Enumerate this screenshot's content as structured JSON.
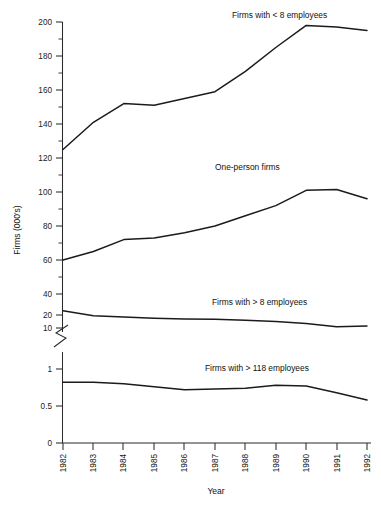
{
  "chart_data": {
    "type": "line",
    "title": "",
    "xlabel": "Year",
    "ylabel": "Firms (000's)",
    "grid": false,
    "legend_position": "inline-labels",
    "axis_note": "y-axis is broken between 10 and 1 (upper linear segment 0–40+ in tens, lower segment 0–1 in halves)",
    "categories": [
      "1982",
      "1983",
      "1984",
      "1985",
      "1986",
      "1987",
      "1988",
      "1989",
      "1990",
      "1991",
      "1992"
    ],
    "x": [
      1982,
      1983,
      1984,
      1985,
      1986,
      1987,
      1988,
      1989,
      1990,
      1991,
      1992
    ],
    "ytick_labels_upper": [
      "200",
      "180",
      "160",
      "140",
      "120",
      "100",
      "80",
      "60",
      "40",
      "20",
      "10"
    ],
    "ytick_values_upper": [
      200,
      180,
      160,
      140,
      120,
      100,
      80,
      60,
      40,
      20,
      10
    ],
    "ytick_labels_lower": [
      "1",
      "0.5",
      "0"
    ],
    "ytick_values_lower": [
      1,
      0.5,
      0
    ],
    "ylim_upper": [
      10,
      200
    ],
    "ylim_lower": [
      0,
      1
    ],
    "series": [
      {
        "name": "Firms with < 8 employees",
        "scale": "upper",
        "values": [
          125,
          141,
          152,
          151,
          155,
          159,
          171,
          185,
          198,
          197,
          195
        ]
      },
      {
        "name": "One-person firms",
        "scale": "upper",
        "values": [
          60,
          65,
          72,
          73,
          76,
          80,
          86,
          92,
          101,
          101.5,
          96
        ]
      },
      {
        "name": "Firms with > 8 employees",
        "scale": "upper",
        "values": [
          24,
          19.5,
          18.5,
          17.5,
          17,
          16.8,
          16,
          15,
          13.5,
          11,
          11.5
        ]
      },
      {
        "name": "Firms with > 118 employees",
        "scale": "lower",
        "values": [
          0.82,
          0.82,
          0.8,
          0.76,
          0.72,
          0.73,
          0.74,
          0.78,
          0.77,
          0.68,
          0.58
        ]
      }
    ],
    "series_label_anchors": [
      {
        "label": "Firms with < 8 employees",
        "x": 232,
        "y": 18
      },
      {
        "label": "One-person firms",
        "x": 215,
        "y": 170
      },
      {
        "label": "Firms with > 8 employees",
        "x": 212,
        "y": 305
      },
      {
        "label": "Firms with > 118 employees",
        "x": 205,
        "y": 371
      }
    ]
  }
}
